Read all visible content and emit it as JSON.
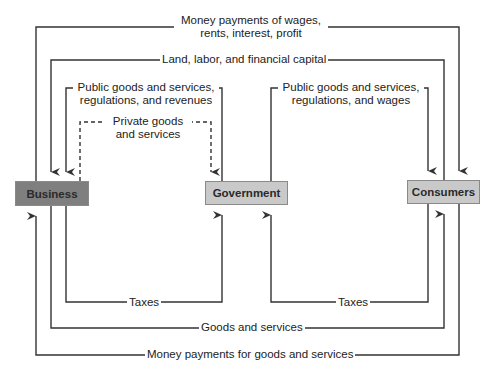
{
  "nodes": {
    "business": {
      "label": "Business",
      "fill": "#7f7f7f"
    },
    "government": {
      "label": "Government",
      "fill": "#c9c9c9"
    },
    "consumers": {
      "label": "Consumers",
      "fill": "#c9c9c9"
    }
  },
  "flows": {
    "money_wages": {
      "line1": "Money payments of wages,",
      "line2": "rents, interest, profit",
      "from": "Business",
      "to": "Consumers"
    },
    "land_labor": {
      "label": "Land, labor, and financial capital",
      "from": "Consumers",
      "to": "Business"
    },
    "public_goods_business": {
      "line1": "Public goods and services,",
      "line2": "regulations, and revenues",
      "from": "Government",
      "to": "Business"
    },
    "private_goods": {
      "line1": "Private goods",
      "line2": "and services",
      "from": "Business",
      "to": "Government",
      "style": "dashed"
    },
    "public_goods_consumers": {
      "line1": "Public goods and services,",
      "line2": "regulations, and wages",
      "from": "Government",
      "to": "Consumers"
    },
    "taxes_business": {
      "label": "Taxes",
      "from": "Business",
      "to": "Government"
    },
    "taxes_consumers": {
      "label": "Taxes",
      "from": "Consumers",
      "to": "Government"
    },
    "goods_services": {
      "label": "Goods and services",
      "from": "Business",
      "to": "Consumers"
    },
    "money_goods": {
      "label": "Money payments for goods and services",
      "from": "Consumers",
      "to": "Business"
    }
  },
  "colors": {
    "line": "#333333",
    "background": "#ffffff"
  }
}
